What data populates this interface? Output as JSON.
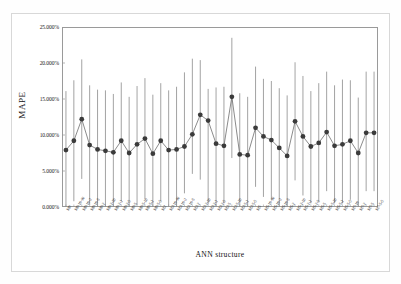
{
  "figure": {
    "background_color": "#ffffff",
    "frame_color": "#d8d8d8",
    "plot_border_color": "#9a9a9a"
  },
  "chart_data": {
    "type": "line",
    "title": "",
    "subtitle": "",
    "xlabel": "ANN structure",
    "ylabel": "MAPE",
    "ylim": [
      0,
      25
    ],
    "ytick_labels": [
      "0.000%",
      "5.000%",
      "10.000%",
      "15.000%",
      "20.000%",
      "25.000%"
    ],
    "ytick_values": [
      0,
      5,
      10,
      15,
      20,
      25
    ],
    "grid": false,
    "legend": false,
    "legend_position": "none",
    "marker_color": "#3b3b3b",
    "line_color": "#6d6d6d",
    "errorbar_color": "#8c8c8c",
    "value_unit": "%",
    "annotation": "Mean MAPE with error bars (min-max range) per ANN structure",
    "categories": [
      "M0",
      "M0-10-10",
      "M0-10-2",
      "M0-10-5",
      "M0-2",
      "M0-2-10",
      "M0-2-2",
      "M0-2-5",
      "M0-5",
      "M0-5-10",
      "M0-5-2",
      "M0-5-5",
      "M2",
      "M2-10-10",
      "M2-10-2",
      "M2-10-5",
      "M2-2",
      "M2-2-10",
      "M2-2-2",
      "M2-2-5",
      "M2-5",
      "M2-5-10",
      "M2-5-2",
      "M2-5-5",
      "M5",
      "M5-10-10",
      "M5-10-2",
      "M5-10-5",
      "M5-2",
      "M5-2-10",
      "M5-2-2",
      "M5-2-5",
      "M5-5",
      "M5-5-10",
      "M5-5-2",
      "M5-5-5",
      "M7-10",
      "M7-2",
      "M7-5",
      "M7-5-5"
    ],
    "values": [
      7.9,
      9.2,
      12.2,
      8.6,
      8.0,
      7.8,
      7.6,
      9.2,
      7.5,
      8.7,
      9.5,
      7.4,
      9.2,
      7.9,
      8.0,
      8.4,
      10.1,
      12.8,
      12.0,
      8.8,
      8.5,
      15.3,
      7.3,
      7.2,
      11.0,
      9.8,
      9.3,
      8.2,
      7.1,
      11.9,
      9.8,
      8.4,
      8.9,
      10.4,
      8.5,
      8.7,
      9.2,
      7.5,
      10.3,
      10.3
    ],
    "err_low": [
      -0.3,
      0.8,
      3.9,
      0.3,
      -0.2,
      -0.3,
      -0.5,
      0.8,
      -0.1,
      0.3,
      1.1,
      -1.0,
      0.8,
      -0.3,
      -0.1,
      1.9,
      4.6,
      3.8,
      0.4,
      0.0,
      0.5,
      6.8,
      -0.9,
      -0.5,
      2.8,
      1.4,
      1.0,
      0.0,
      -1.0,
      3.7,
      1.6,
      0.5,
      0.7,
      2.2,
      0.5,
      0.5,
      1.0,
      -0.7,
      2.2,
      2.2
    ],
    "err_high": [
      16.1,
      17.6,
      20.5,
      16.9,
      16.3,
      16.2,
      15.7,
      17.3,
      15.3,
      16.8,
      17.9,
      15.6,
      17.2,
      16.2,
      16.7,
      18.7,
      20.6,
      20.4,
      16.4,
      16.6,
      16.7,
      23.5,
      15.8,
      15.3,
      19.5,
      17.8,
      17.5,
      16.5,
      15.5,
      20.1,
      18.2,
      16.1,
      17.2,
      18.8,
      16.9,
      17.7,
      17.6,
      15.2,
      18.8,
      18.8
    ]
  },
  "axes": {
    "y_title": "MAPE",
    "x_title": "ANN structure"
  }
}
